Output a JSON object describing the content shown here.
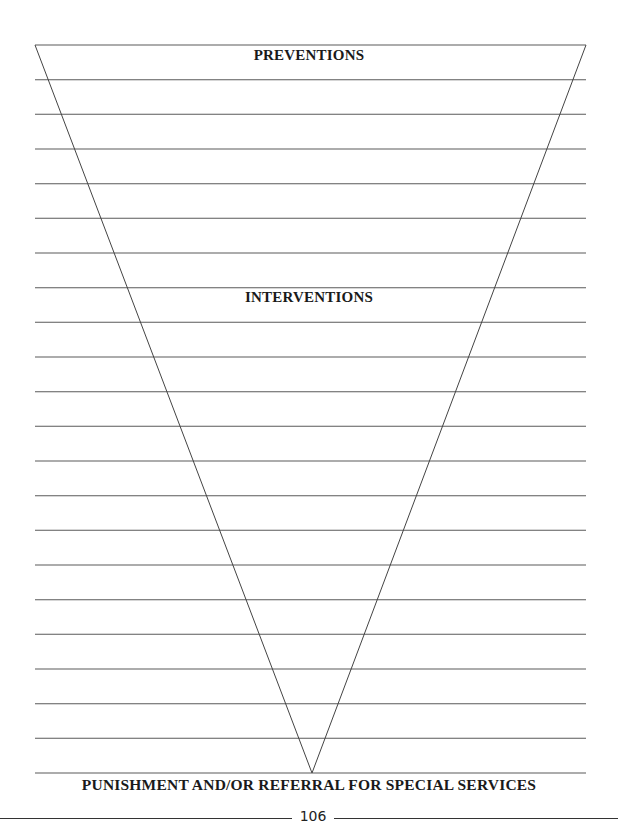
{
  "worksheet": {
    "top_label": "PREVENTIONS",
    "middle_label": "INTERVENTIONS",
    "bottom_label": "PUNISHMENT AND/OR REFERRAL FOR SPECIAL SERVICES",
    "line_count": 22,
    "line_color": "#555555",
    "triangle": {
      "top_left": [
        35,
        45
      ],
      "top_right": [
        586,
        45
      ],
      "apex": [
        312,
        773
      ]
    }
  },
  "footer": {
    "page_number": "106"
  }
}
